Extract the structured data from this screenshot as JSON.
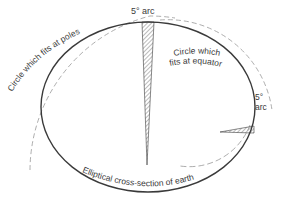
{
  "diagram": {
    "labels": {
      "top_arc": "5° arc",
      "right_arc_line1": "5°",
      "right_arc_line2": "arc",
      "poles_circle": "Circle which fits at poles",
      "equator_circle_line1": "Circle which",
      "equator_circle_line2": "fits at equator",
      "ellipse": "Elliptical cross-section of earth"
    },
    "colors": {
      "ink": "#3a3a3a",
      "dashed": "#8a8a8a",
      "background": "#ffffff"
    }
  }
}
